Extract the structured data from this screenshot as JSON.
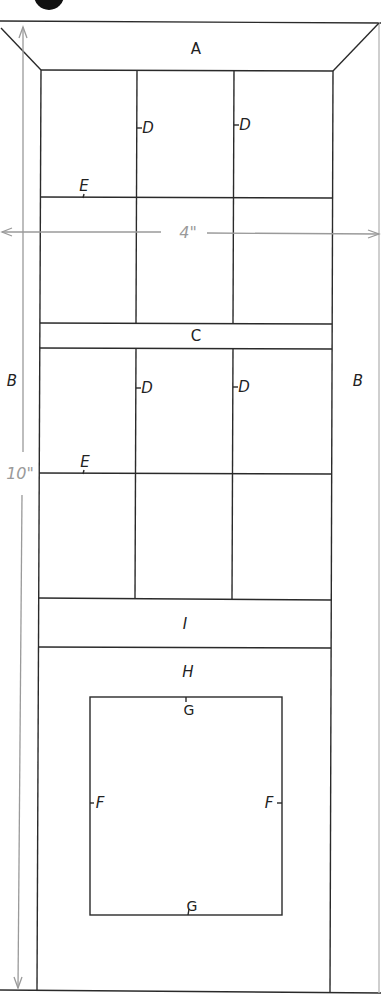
{
  "diagram": {
    "colors": {
      "line": "#2a2a2a",
      "dimension": "#9a9a9a",
      "background": "#ffffff"
    },
    "dimensions": {
      "width": "4\"",
      "height": "10\""
    },
    "labels": {
      "A": "A",
      "B_left": "B",
      "B_right": "B",
      "C": "C",
      "D1": "D",
      "D2": "D",
      "D3": "D",
      "D4": "D",
      "E1": "E",
      "E2": "E",
      "I": "I",
      "H": "H",
      "G_top": "G",
      "G_bottom": "G",
      "F_left": "F",
      "F_right": "F"
    },
    "parts": [
      {
        "id": "A",
        "name": "top rail (beveled)"
      },
      {
        "id": "B",
        "name": "side stiles"
      },
      {
        "id": "C",
        "name": "middle rail"
      },
      {
        "id": "D",
        "name": "vertical muntins"
      },
      {
        "id": "E",
        "name": "horizontal muntins"
      },
      {
        "id": "F",
        "name": "inner panel side frame"
      },
      {
        "id": "G",
        "name": "inner panel top/bottom frame"
      },
      {
        "id": "H",
        "name": "lower panel"
      },
      {
        "id": "I",
        "name": "lower rail"
      }
    ]
  }
}
